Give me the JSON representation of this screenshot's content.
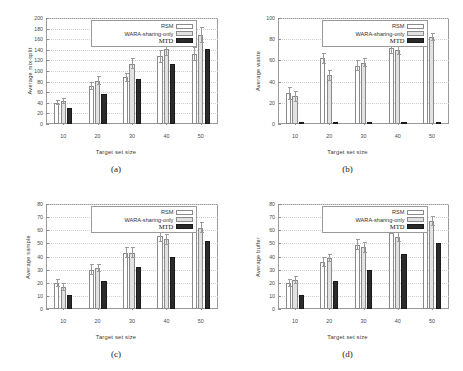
{
  "figure": {
    "panels": [
      {
        "caption": "(a)",
        "chart_data": {
          "type": "bar",
          "title": "",
          "xlabel": "Target set size",
          "ylabel": "Average mix-split",
          "categories": [
            "10",
            "20",
            "30",
            "40",
            "50"
          ],
          "xticks": [
            "10",
            "20",
            "30",
            "40",
            "50"
          ],
          "yticks": [
            "0",
            "20",
            "40",
            "60",
            "80",
            "100",
            "120",
            "140",
            "160",
            "180",
            "200"
          ],
          "ylim": [
            0,
            200
          ],
          "grid": true,
          "legend_position": "top-center",
          "series": [
            {
              "name": "RSM",
              "values": [
                40,
                72,
                88,
                128,
                132
              ],
              "errors": [
                5,
                8,
                9,
                12,
                14
              ]
            },
            {
              "name": "WARA-sharing-only",
              "values": [
                44,
                82,
                114,
                142,
                168
              ],
              "errors": [
                6,
                9,
                10,
                13,
                15
              ]
            },
            {
              "name": "MTD",
              "values": [
                30,
                57,
                85,
                114,
                141
              ],
              "errors": [
                0,
                0,
                0,
                0,
                0
              ]
            }
          ]
        }
      },
      {
        "caption": "(b)",
        "chart_data": {
          "type": "bar",
          "title": "",
          "xlabel": "Target set size",
          "ylabel": "Average waste",
          "categories": [
            "10",
            "20",
            "30",
            "40",
            "50"
          ],
          "xticks": [
            "10",
            "20",
            "30",
            "40",
            "50"
          ],
          "yticks": [
            "0",
            "20",
            "40",
            "60",
            "80",
            "100"
          ],
          "ylim": [
            0,
            100
          ],
          "grid": true,
          "legend_position": "top-center",
          "series": [
            {
              "name": "RSM",
              "values": [
                29,
                62,
                55,
                72,
                83
              ],
              "errors": [
                6,
                5,
                5,
                6,
                5
              ]
            },
            {
              "name": "WARA-sharing-only",
              "values": [
                26,
                46,
                58,
                70,
                82
              ],
              "errors": [
                5,
                5,
                4,
                5,
                4
              ]
            },
            {
              "name": "MTD",
              "values": [
                0,
                0,
                0,
                0,
                0
              ],
              "errors": [
                0,
                0,
                0,
                0,
                0
              ]
            }
          ]
        }
      },
      {
        "caption": "(c)",
        "chart_data": {
          "type": "bar",
          "title": "",
          "xlabel": "Target set size",
          "ylabel": "Average sample",
          "categories": [
            "10",
            "20",
            "30",
            "40",
            "50"
          ],
          "xticks": [
            "10",
            "20",
            "30",
            "40",
            "50"
          ],
          "yticks": [
            "0",
            "10",
            "20",
            "30",
            "40",
            "50",
            "60",
            "70",
            "80"
          ],
          "ylim": [
            0,
            80
          ],
          "grid": true,
          "legend_position": "top-center",
          "series": [
            {
              "name": "RSM",
              "values": [
                20,
                30,
                43,
                56,
                64
              ],
              "errors": [
                3,
                4,
                4,
                5,
                5
              ]
            },
            {
              "name": "WARA-sharing-only",
              "values": [
                17,
                31,
                43,
                53,
                62
              ],
              "errors": [
                3,
                3,
                4,
                4,
                4
              ]
            },
            {
              "name": "MTD",
              "values": [
                11,
                21,
                32,
                40,
                52
              ],
              "errors": [
                0,
                0,
                0,
                0,
                0
              ]
            }
          ]
        }
      },
      {
        "caption": "(d)",
        "chart_data": {
          "type": "bar",
          "title": "",
          "xlabel": "Target set size",
          "ylabel": "Average buffer",
          "categories": [
            "10",
            "20",
            "30",
            "40",
            "50"
          ],
          "xticks": [
            "10",
            "20",
            "30",
            "40",
            "50"
          ],
          "yticks": [
            "0",
            "10",
            "20",
            "30",
            "40",
            "50",
            "60",
            "70",
            "80"
          ],
          "ylim": [
            0,
            80
          ],
          "grid": true,
          "legend_position": "top-center",
          "series": [
            {
              "name": "RSM",
              "values": [
                20,
                36,
                49,
                62,
                67
              ],
              "errors": [
                3,
                4,
                4,
                5,
                4
              ]
            },
            {
              "name": "WARA-sharing-only",
              "values": [
                22,
                39,
                47,
                55,
                67
              ],
              "errors": [
                3,
                3,
                4,
                4,
                4
              ]
            },
            {
              "name": "MTD",
              "values": [
                11,
                21,
                30,
                42,
                50
              ],
              "errors": [
                0,
                0,
                0,
                0,
                0
              ]
            }
          ]
        }
      }
    ],
    "legend_labels": {
      "rsm": "RSM",
      "wara": "WARA-sharing-only",
      "mtd": "MTD"
    },
    "colors": {
      "rsm": "#ffffff",
      "wara": "#e2e2e2",
      "mtd": "#2b2b2b",
      "axis": "#9a9a9a"
    }
  }
}
